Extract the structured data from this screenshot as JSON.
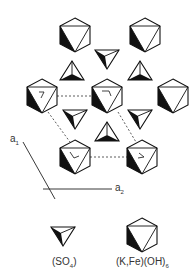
{
  "diagram": {
    "title": "",
    "axes": {
      "a1": {
        "label": "a",
        "sub": "1"
      },
      "a2": {
        "label": "a",
        "sub": "2"
      }
    },
    "octahedra": [
      {
        "x": 75,
        "y": 35,
        "mark": false
      },
      {
        "x": 145,
        "y": 35,
        "mark": false
      },
      {
        "x": 42,
        "y": 96,
        "mark": true
      },
      {
        "x": 107,
        "y": 96,
        "mark": true
      },
      {
        "x": 173,
        "y": 96,
        "mark": false
      },
      {
        "x": 75,
        "y": 157,
        "mark": true
      },
      {
        "x": 142,
        "y": 157,
        "mark": true
      }
    ],
    "tetrahedra_down": [
      {
        "x": 107,
        "y": 58
      },
      {
        "x": 75,
        "y": 118
      },
      {
        "x": 140,
        "y": 118
      }
    ],
    "tetrahedra_up": [
      {
        "x": 72,
        "y": 72
      },
      {
        "x": 140,
        "y": 72
      },
      {
        "x": 107,
        "y": 133
      }
    ],
    "legend": [
      {
        "symbol": "tetrahedron",
        "label": "(SO",
        "sub": "4",
        "tail": ")"
      },
      {
        "symbol": "octahedron",
        "label": "(K,Fe)(OH)",
        "sub": "6",
        "tail": ""
      }
    ]
  }
}
